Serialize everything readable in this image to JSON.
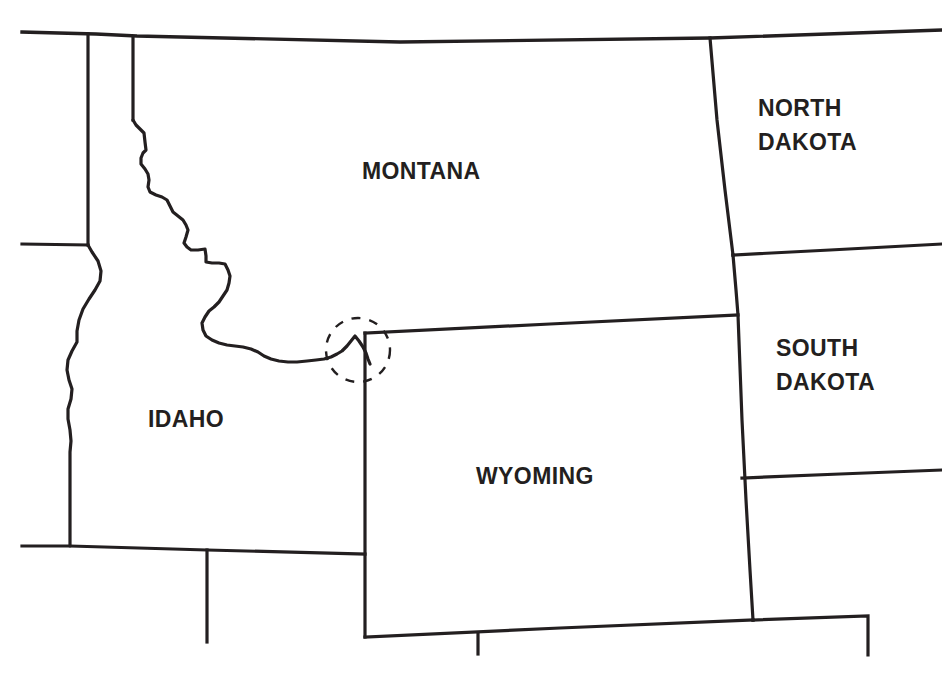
{
  "map": {
    "title": "Northern Rocky Mountain / Northern Plains state outline map",
    "description": "Black-and-white line map of state boundaries with a dashed circle annotation at the Montana-Idaho-Wyoming tripoint",
    "background_color": "#ffffff",
    "line_color": "#231f20",
    "label_color": "#231f20",
    "annotation_color": "#231f20",
    "labels": [
      {
        "id": "montana",
        "text": "MONTANA",
        "x": 362,
        "y": 157
      },
      {
        "id": "north_dakota",
        "text": "NORTH\nDAKOTA",
        "x": 758,
        "y": 91
      },
      {
        "id": "south_dakota",
        "text": "SOUTH\nDAKOTA",
        "x": 776,
        "y": 331
      },
      {
        "id": "idaho",
        "text": "IDAHO",
        "x": 148,
        "y": 405
      },
      {
        "id": "wyoming",
        "text": "WYOMING",
        "x": 476,
        "y": 462
      }
    ],
    "annotation": {
      "name": "tripoint-highlight-circle",
      "style": "dashed",
      "cx": 358,
      "cy": 350,
      "r": 32
    },
    "borders": [
      {
        "id": "canada-north-border",
        "name": "northern-international-border"
      },
      {
        "id": "wa-or-border",
        "name": "washington-oregon-border-stub"
      },
      {
        "id": "id-west-border",
        "name": "idaho-western-border"
      },
      {
        "id": "id-mt-border",
        "name": "idaho-montana-continental-divide"
      },
      {
        "id": "mt-nd-border",
        "name": "montana-north-dakota-border"
      },
      {
        "id": "nd-sd-border",
        "name": "north-dakota-south-dakota-border"
      },
      {
        "id": "mt-sd-wy-border",
        "name": "montana-south-dakota-wyoming-border"
      },
      {
        "id": "wy-box",
        "name": "wyoming-state-outline"
      },
      {
        "id": "id-south-border",
        "name": "idaho-southern-border"
      },
      {
        "id": "nv-ut-stub",
        "name": "nevada-utah-border-stub"
      },
      {
        "id": "ut-co-stub",
        "name": "utah-colorado-border-stub"
      },
      {
        "id": "sd-ne-stub",
        "name": "south-dakota-nebraska-border-stub"
      }
    ]
  }
}
